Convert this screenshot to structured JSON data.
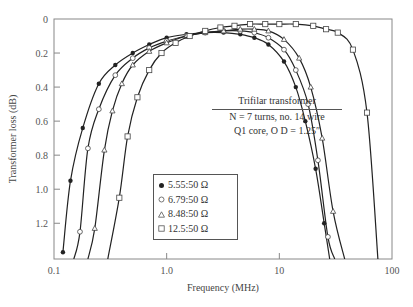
{
  "chart_data": {
    "type": "line",
    "title": "",
    "xlabel": "Frequency (MHz)",
    "ylabel": "Transformer loss (dB)",
    "xscale": "log",
    "xlim": [
      0.1,
      100
    ],
    "ylim": [
      0,
      1.41
    ],
    "y_inverted": true,
    "grid": false,
    "x_ticks": [
      "0.1",
      "1.0",
      "10",
      "100"
    ],
    "y_ticks": [
      "0",
      "0.2",
      "0.4",
      "0.6",
      "0.8",
      "1.0",
      "1.2"
    ],
    "annotation": {
      "title": "Trifilar transformer",
      "line1": "N = 7 turns, no. 14 wire",
      "line2": "Q1 core, O D = 1.25″"
    },
    "legend": [
      {
        "marker": "filled-circle",
        "label": "5.55:50 Ω"
      },
      {
        "marker": "open-circle",
        "label": "6.79:50 Ω"
      },
      {
        "marker": "open-triangle",
        "label": "8.48:50 Ω"
      },
      {
        "marker": "open-square",
        "label": "12.5:50 Ω"
      }
    ],
    "series": [
      {
        "name": "5.55:50 Ω",
        "marker": "filled-circle",
        "x": [
          0.12,
          0.14,
          0.18,
          0.25,
          0.35,
          0.5,
          0.7,
          1.0,
          1.5,
          2.2,
          3.2,
          4.5,
          6.0,
          8.0,
          11,
          14,
          17,
          21,
          25,
          28
        ],
        "y": [
          1.37,
          0.95,
          0.64,
          0.38,
          0.27,
          0.2,
          0.15,
          0.11,
          0.09,
          0.08,
          0.08,
          0.09,
          0.11,
          0.15,
          0.25,
          0.4,
          0.6,
          0.88,
          1.2,
          1.41
        ]
      },
      {
        "name": "6.79:50 Ω",
        "marker": "open-circle",
        "x": [
          0.15,
          0.17,
          0.2,
          0.25,
          0.35,
          0.5,
          0.7,
          1.0,
          1.5,
          2.2,
          3.2,
          4.5,
          6.0,
          8.0,
          11,
          14,
          18,
          22,
          27,
          31
        ],
        "y": [
          1.41,
          1.25,
          0.76,
          0.53,
          0.33,
          0.23,
          0.17,
          0.13,
          0.1,
          0.08,
          0.07,
          0.07,
          0.08,
          0.11,
          0.18,
          0.3,
          0.5,
          0.83,
          1.28,
          1.41
        ]
      },
      {
        "name": "8.48:50 Ω",
        "marker": "open-triangle",
        "x": [
          0.2,
          0.23,
          0.28,
          0.33,
          0.4,
          0.5,
          0.7,
          1.0,
          1.5,
          2.2,
          3.2,
          4.5,
          6.0,
          8.0,
          11,
          15,
          19,
          24,
          30,
          38
        ],
        "y": [
          1.41,
          1.23,
          0.77,
          0.54,
          0.38,
          0.27,
          0.19,
          0.14,
          0.1,
          0.08,
          0.07,
          0.06,
          0.06,
          0.07,
          0.12,
          0.23,
          0.4,
          0.7,
          1.13,
          1.41
        ]
      },
      {
        "name": "12.5:50 Ω",
        "marker": "open-square",
        "x": [
          0.3,
          0.38,
          0.45,
          0.55,
          0.7,
          0.9,
          1.2,
          1.6,
          2.2,
          3.0,
          4.0,
          5.5,
          7.5,
          10,
          14,
          20,
          26,
          33,
          45,
          60,
          75
        ],
        "y": [
          1.41,
          1.05,
          0.69,
          0.46,
          0.3,
          0.2,
          0.14,
          0.1,
          0.07,
          0.05,
          0.04,
          0.03,
          0.03,
          0.03,
          0.03,
          0.04,
          0.06,
          0.08,
          0.18,
          0.55,
          1.41
        ]
      }
    ]
  }
}
